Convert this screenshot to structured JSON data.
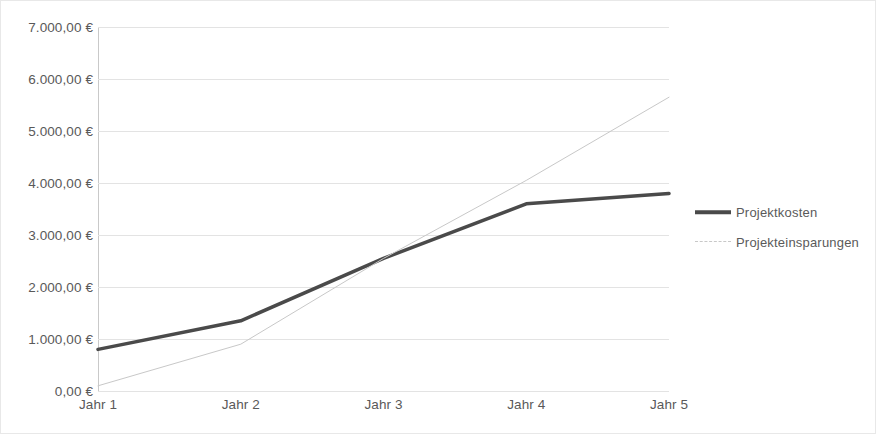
{
  "chart_data": {
    "type": "line",
    "title": "",
    "subtitle": "",
    "xlabel": "",
    "ylabel": "",
    "categories": [
      "Jahr 1",
      "Jahr 2",
      "Jahr 3",
      "Jahr 4",
      "Jahr 5"
    ],
    "ylim": [
      0,
      7000
    ],
    "ytick_values": [
      0,
      1000,
      2000,
      3000,
      4000,
      5000,
      6000,
      7000
    ],
    "ytick_labels": [
      "0,00 €",
      "1.000,00 €",
      "2.000,00 €",
      "3.000,00 €",
      "4.000,00 €",
      "5.000,00 €",
      "6.000,00 €",
      "7.000,00 €"
    ],
    "grid": true,
    "grid_axis": "y",
    "legend_position": "right",
    "currency_symbol": "€",
    "series": [
      {
        "name": "Projektkosten",
        "values": [
          800,
          1350,
          2550,
          3600,
          3800
        ],
        "color": "#4a4a4a",
        "line_style": "solid",
        "line_width": 3.5
      },
      {
        "name": "Projekteinsparungen",
        "values": [
          100,
          900,
          2550,
          4050,
          5650
        ],
        "color": "#c8c8c8",
        "line_style": "solid",
        "line_width": 1
      }
    ]
  },
  "legend": {
    "items": [
      {
        "label": "Projektkosten",
        "marker": "thick-line-marker"
      },
      {
        "label": "Projekteinsparungen",
        "marker": "thin-line-marker"
      }
    ]
  }
}
